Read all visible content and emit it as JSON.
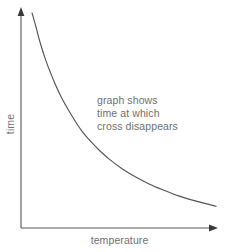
{
  "figure": {
    "background_color": "#ffffff",
    "width": 227,
    "height": 252
  },
  "axes": {
    "line_color": "#555555",
    "x_axis_name": "temperature",
    "y_axis_name": "time",
    "x_label": "temperature",
    "y_label": "time",
    "x_has_arrow": true,
    "y_has_arrow": true
  },
  "annotation": {
    "color": "#6f6f6f",
    "line1": "graph shows",
    "line2": "time at which",
    "line3": "cross disappears"
  },
  "chart_data": {
    "type": "line",
    "title": "",
    "xlabel": "temperature",
    "ylabel": "time",
    "grid": false,
    "legend": "none",
    "axis_ticks": "none",
    "xlim": [
      0,
      1
    ],
    "ylim": [
      0,
      1
    ],
    "series": [
      {
        "name": "time at which cross disappears",
        "color": "#555555",
        "description": "monotonically decreasing convex curve (inverse / exponential decay); time falls steeply at low temperature then flattens toward the right",
        "x": [
          0.056,
          0.075,
          0.097,
          0.125,
          0.15,
          0.175,
          0.206,
          0.243,
          0.285,
          0.315,
          0.355,
          0.4,
          0.451,
          0.515,
          0.58,
          0.65,
          0.72,
          0.8,
          0.88,
          0.99
        ],
        "y": [
          0.991,
          0.93,
          0.855,
          0.775,
          0.715,
          0.66,
          0.6,
          0.54,
          0.478,
          0.44,
          0.398,
          0.356,
          0.315,
          0.272,
          0.236,
          0.203,
          0.176,
          0.148,
          0.126,
          0.1
        ]
      }
    ],
    "annotations": [
      {
        "text": "graph shows time at which cross disappears",
        "x": 0.39,
        "y": 0.62
      }
    ]
  }
}
